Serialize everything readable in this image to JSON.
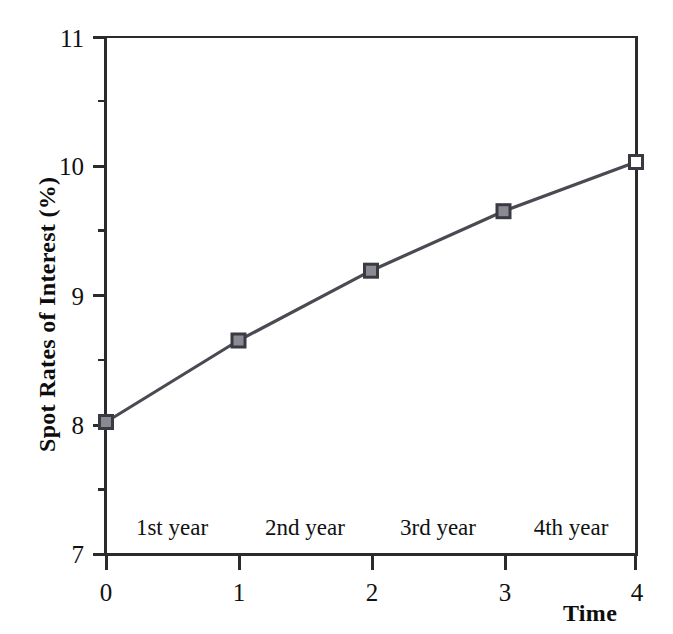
{
  "chart_data": {
    "type": "line",
    "title": "",
    "xlabel": "Time",
    "ylabel": "Spot Rates of Interest (%)",
    "x": [
      0,
      1,
      2,
      3,
      4
    ],
    "values": [
      8.02,
      8.65,
      9.19,
      9.65,
      10.03
    ],
    "series": [
      {
        "name": "Spot Rates of Interest",
        "values": [
          8.02,
          8.65,
          9.19,
          9.65,
          10.03
        ]
      }
    ],
    "xlim": [
      0,
      4
    ],
    "ylim": [
      7,
      11
    ],
    "x_ticks": [
      "0",
      "1",
      "2",
      "3",
      "4"
    ],
    "y_ticks": [
      "7",
      "8",
      "9",
      "10",
      "11"
    ],
    "y_minor_ticks": [
      7.5,
      8.5,
      9.5,
      10.5
    ],
    "grid": false,
    "legend": false,
    "marker": "square",
    "line_color": "#4a4a52",
    "marker_edge_color": "#3a3a42",
    "marker_face_color": "#8a8a92",
    "axis_color": "#2b2b2b",
    "annotations": [
      "1st year",
      "2nd year",
      "3rd year",
      "4th year"
    ]
  },
  "axes": {
    "y_title": "Spot Rates of Interest (%)",
    "x_title": "Time",
    "y_tick_labels": [
      "11",
      "10",
      "9",
      "8",
      "7"
    ],
    "x_tick_labels": [
      "0",
      "1",
      "2",
      "3",
      "4"
    ]
  },
  "span_labels": [
    {
      "label": "1st year",
      "start": 0,
      "end": 1
    },
    {
      "label": "2nd year",
      "start": 1,
      "end": 2
    },
    {
      "label": "3rd year",
      "start": 2,
      "end": 3
    },
    {
      "label": "4th year",
      "start": 3,
      "end": 4
    }
  ]
}
